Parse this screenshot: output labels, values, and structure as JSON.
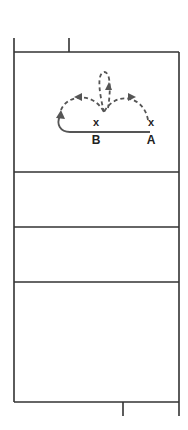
{
  "diagram": {
    "type": "volleyball-court-play-diagram",
    "colors": {
      "court_line": "#333333",
      "movement_path": "#555555",
      "text": "#222222",
      "background": "#ffffff"
    },
    "players": [
      {
        "id": "B",
        "marker": "x",
        "label": "B"
      },
      {
        "id": "A",
        "marker": "x",
        "label": "A"
      }
    ],
    "paths": [
      {
        "from": "A",
        "style": "solid",
        "description": "A moves left along baseline past B and curves up"
      },
      {
        "style": "dashed",
        "description": "arc from left curve to center with arrow"
      },
      {
        "style": "dashed",
        "description": "arc from A's position up to center with arrow"
      },
      {
        "style": "dashed",
        "description": "loop upward from center with arrow"
      }
    ]
  }
}
